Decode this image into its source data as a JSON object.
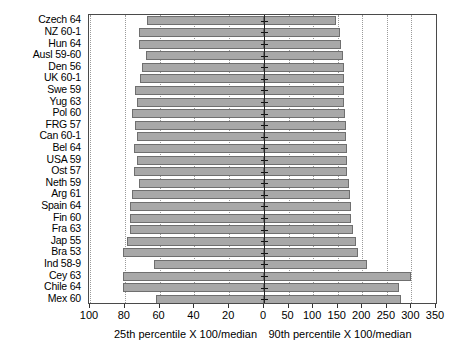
{
  "chart_data": {
    "type": "bar",
    "orientation": "horizontal",
    "subtype": "back-to-back population pyramid",
    "title": "",
    "left_axis": {
      "label": "25th percentile X 100/median",
      "ticks": [
        100,
        80,
        60,
        40,
        20,
        0
      ],
      "range": [
        100,
        0
      ],
      "direction": "descending-left-to-right"
    },
    "right_axis": {
      "label": "90th percentile X 100/median",
      "ticks": [
        0,
        50,
        100,
        150,
        200,
        250,
        300,
        350
      ],
      "range": [
        0,
        350
      ],
      "direction": "ascending-left-to-right"
    },
    "grid": "vertical dotted gridlines at each tick",
    "legend": "none",
    "categories": [
      "Czech 64",
      "NZ 60-1",
      "Hun 64",
      "Ausl 59-60",
      "Den 56",
      "UK 60-1",
      "Swe 59",
      "Yug 63",
      "Pol 60",
      "FRG 57",
      "Can 60-1",
      "Bel 64",
      "USA 59",
      "Ost 57",
      "Neth 59",
      "Arg 61",
      "Spain 64",
      "Fin 60",
      "Fra 63",
      "Jap 55",
      "Bra 53",
      "Ind 58-9",
      "Cey 63",
      "Chile 64",
      "Mex 60"
    ],
    "series": [
      {
        "name": "25th percentile X 100/median",
        "axis": "left",
        "values": [
          67,
          72,
          72,
          68,
          70,
          71,
          74,
          73,
          76,
          74,
          73,
          75,
          73,
          75,
          72,
          76,
          77,
          77,
          77,
          79,
          81,
          63,
          81,
          81,
          62
        ]
      },
      {
        "name": "90th percentile X 100/median",
        "axis": "right",
        "values": [
          147,
          154,
          157,
          160,
          162,
          163,
          163,
          163,
          164,
          166,
          166,
          168,
          168,
          169,
          172,
          175,
          177,
          177,
          181,
          188,
          192,
          210,
          300,
          275,
          278
        ]
      }
    ]
  },
  "axis_labels": {
    "left_caption": "25th percentile X 100/median",
    "right_caption": "90th percentile X 100/median"
  }
}
